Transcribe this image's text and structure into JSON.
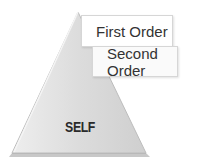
{
  "diagram": {
    "type": "pyramid",
    "base_label": "SELF",
    "labels": [
      {
        "text": "First Order"
      },
      {
        "text": "Second Order"
      }
    ],
    "colors": {
      "triangle_fill": "#d9d9d9",
      "triangle_edge": "#bdbdbd",
      "box_border": "#d6d6d6",
      "text": "#333333"
    }
  }
}
